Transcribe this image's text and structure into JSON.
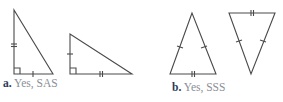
{
  "parts": [
    {
      "id": "a",
      "letter": "a.",
      "answer": "Yes, SAS",
      "triangles": [
        {
          "name": "right-triangle-1",
          "vertices": [
            [
              14,
              10
            ],
            [
              14,
              74
            ],
            [
              53,
              74
            ]
          ],
          "right_angle_at": [
            14,
            74
          ],
          "tick_marks": [
            {
              "side": "vertical-leg",
              "count": 2
            },
            {
              "side": "bottom-leg",
              "count": 1
            }
          ]
        },
        {
          "name": "right-triangle-2",
          "vertices": [
            [
              70,
              34
            ],
            [
              70,
              74
            ],
            [
              132,
              74
            ]
          ],
          "right_angle_at": [
            70,
            74
          ],
          "tick_marks": [
            {
              "side": "vertical-leg",
              "count": 1
            },
            {
              "side": "bottom-leg",
              "count": 2
            }
          ]
        }
      ]
    },
    {
      "id": "b",
      "letter": "b.",
      "answer": "Yes, SSS",
      "triangles": [
        {
          "name": "isosceles-triangle-up",
          "vertices": [
            [
              192,
              13
            ],
            [
              170,
              74
            ],
            [
              216,
              74
            ]
          ],
          "tick_marks": [
            {
              "side": "left-side",
              "count": 1
            },
            {
              "side": "right-side",
              "count": 1
            },
            {
              "side": "base",
              "count": 2
            }
          ]
        },
        {
          "name": "isosceles-triangle-down",
          "vertices": [
            [
              229,
              13
            ],
            [
              275,
              13
            ],
            [
              251,
              74
            ]
          ],
          "tick_marks": [
            {
              "side": "left-side",
              "count": 1
            },
            {
              "side": "right-side",
              "count": 1
            },
            {
              "side": "top-base",
              "count": 2
            }
          ]
        }
      ]
    }
  ],
  "colors": {
    "stroke": "#4a4a4a",
    "letter": "#2a3a5a",
    "answer": "#8a8f98"
  }
}
